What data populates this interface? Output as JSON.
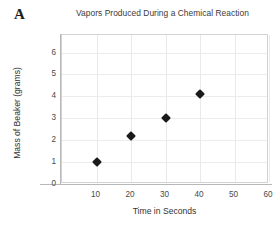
{
  "panel": {
    "label": "A"
  },
  "chart_data": {
    "type": "scatter",
    "title": "Vapors Produced During a Chemical Reaction",
    "xlabel": "Time in Seconds",
    "ylabel": "Mass of Beaker (grams)",
    "x": [
      10,
      20,
      30,
      40
    ],
    "values": [
      1,
      2.2,
      3,
      4.1
    ],
    "points": [
      {
        "x": 10,
        "y": 1
      },
      {
        "x": 20,
        "y": 2.2
      },
      {
        "x": 30,
        "y": 3
      },
      {
        "x": 40,
        "y": 4.1
      }
    ],
    "xlim": [
      0,
      60
    ],
    "ylim": [
      0,
      6.8
    ],
    "xticks": [
      10,
      20,
      30,
      40,
      50,
      60
    ],
    "yticks": [
      0,
      1,
      2,
      3,
      4,
      5,
      6
    ],
    "xtick_labels": [
      "10",
      "20",
      "30",
      "40",
      "50",
      "60"
    ],
    "ytick_labels": [
      "0",
      "1",
      "2",
      "3",
      "4",
      "5",
      "6"
    ],
    "grid": true,
    "legend": null,
    "marker": "diamond",
    "marker_color": "#1a1a1a",
    "grid_color": "#e9e9e9",
    "axis_color": "#b8b8b8"
  }
}
